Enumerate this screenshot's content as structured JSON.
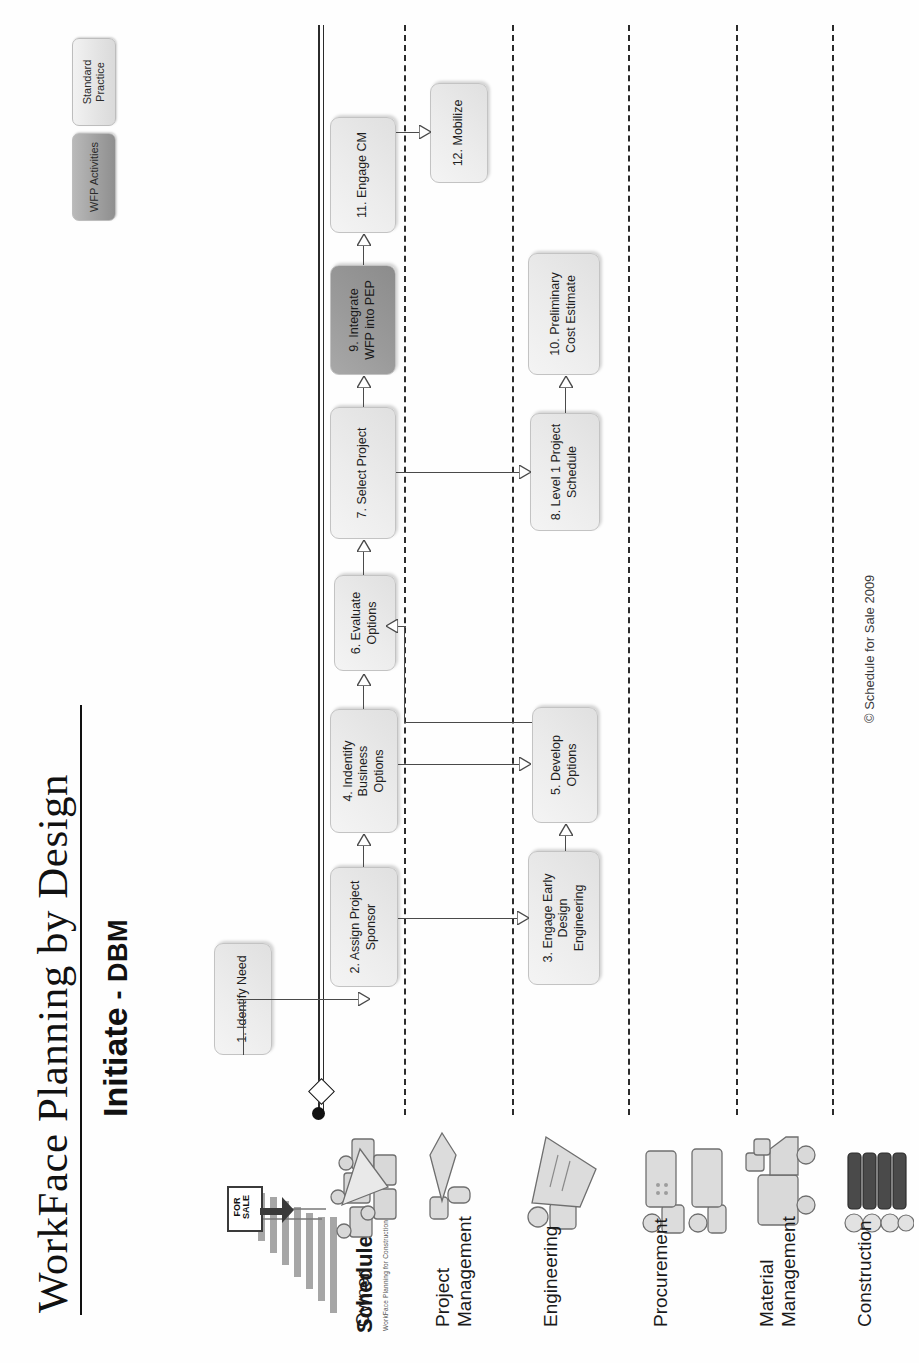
{
  "document": {
    "title": "WorkFace Planning by Design",
    "subtitle_main": "Initiate",
    "subtitle_sep": " - ",
    "subtitle_abbr": "DBM",
    "copyright": "© Schedule for Sale 2009"
  },
  "brand": {
    "name": "Schedule",
    "tagline": "WorkFace Planning for Construction Projects",
    "sign_line1": "FOR",
    "sign_line2": "SALE"
  },
  "legend": {
    "items": [
      {
        "label": "WFP\nActivities",
        "style": "wfp",
        "color": "#9f9f9f"
      },
      {
        "label": "Standard\nPractice",
        "style": "std",
        "color": "#e3e3e3"
      }
    ]
  },
  "swimlanes": [
    {
      "id": "owner",
      "label": "Owner",
      "icon": "people-group-icon"
    },
    {
      "id": "project-management",
      "label": "Project\nManagement",
      "icon": "handshake-icon"
    },
    {
      "id": "engineering",
      "label": "Engineering",
      "icon": "person-drafting-icon"
    },
    {
      "id": "procurement",
      "label": "Procurement",
      "icon": "two-people-desk-icon"
    },
    {
      "id": "material-management",
      "label": "Material\nManagement",
      "icon": "delivery-truck-icon"
    },
    {
      "id": "construction",
      "label": "Construction",
      "icon": "crew-workers-icon"
    }
  ],
  "nodes": [
    {
      "id": "n1",
      "number": "1.",
      "label": "1. Identify Need",
      "lane": "owner",
      "type": "std"
    },
    {
      "id": "n2",
      "number": "2.",
      "label": "2. Assign Project\nSponsor",
      "lane": "owner",
      "type": "std"
    },
    {
      "id": "n3",
      "number": "3.",
      "label": "3. Engage Early Design\nEngineering",
      "lane": "engineering",
      "type": "std"
    },
    {
      "id": "n4",
      "number": "4.",
      "label": "4. Indentify Business\nOptions",
      "lane": "owner",
      "type": "std"
    },
    {
      "id": "n5",
      "number": "5.",
      "label": "5. Develop Options",
      "lane": "engineering",
      "type": "std"
    },
    {
      "id": "n6",
      "number": "6.",
      "label": "6. Evaluate\nOptions",
      "lane": "owner",
      "type": "std"
    },
    {
      "id": "n7",
      "number": "7.",
      "label": "7. Select Project",
      "lane": "owner",
      "type": "std"
    },
    {
      "id": "n8",
      "number": "8.",
      "label": "8. Level 1 Project\nSchedule",
      "lane": "engineering",
      "type": "std"
    },
    {
      "id": "n9",
      "number": "9.",
      "label": "9. Integrate\nWFP into PEP",
      "lane": "owner",
      "type": "wfp"
    },
    {
      "id": "n10",
      "number": "10.",
      "label": "10. Preliminary\nCost Estimate",
      "lane": "engineering",
      "type": "std"
    },
    {
      "id": "n11",
      "number": "11.",
      "label": "11. Engage CM",
      "lane": "owner",
      "type": "std"
    },
    {
      "id": "n12",
      "number": "12.",
      "label": "12. Mobilize",
      "lane": "project-management",
      "type": "std"
    }
  ],
  "connections": [
    {
      "from": "n1",
      "to": "n2"
    },
    {
      "from": "n2",
      "to": "n4"
    },
    {
      "from": "n2",
      "to": "n3"
    },
    {
      "from": "n4",
      "to": "n5"
    },
    {
      "from": "n3",
      "to": "n5"
    },
    {
      "from": "n5",
      "to": "n6"
    },
    {
      "from": "n6",
      "to": "n7"
    },
    {
      "from": "n7",
      "to": "n8"
    },
    {
      "from": "n7",
      "to": "n9"
    },
    {
      "from": "n8",
      "to": "n10"
    },
    {
      "from": "n9",
      "to": "n11"
    },
    {
      "from": "n11",
      "to": "n12"
    }
  ]
}
